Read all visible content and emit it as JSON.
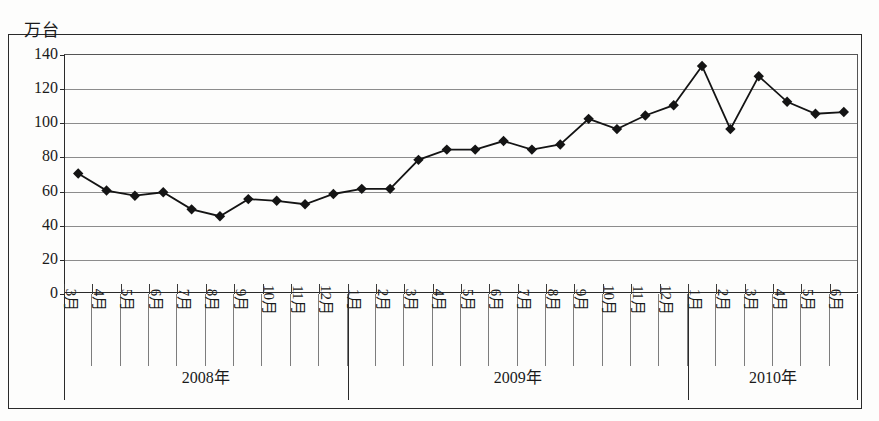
{
  "chart_data": {
    "type": "line",
    "title": "",
    "subtitle": "",
    "xlabel": "",
    "ylabel": "万台",
    "unit_label": "万台",
    "ylim": [
      0,
      140
    ],
    "yticks": [
      0,
      20,
      40,
      60,
      80,
      100,
      120,
      140
    ],
    "ytick_labels": [
      "0",
      "20",
      "40",
      "60",
      "80",
      "100",
      "120",
      "140"
    ],
    "grid": true,
    "legend": "none",
    "marker": "diamond",
    "line_color": "#141414",
    "marker_color": "#141414",
    "grid_color": "#8c8c8c",
    "axis_color": "#2a2a2a",
    "categories": [
      "3月",
      "4月",
      "5月",
      "6月",
      "7月",
      "8月",
      "9月",
      "10月",
      "11月",
      "12月",
      "1月",
      "2月",
      "3月",
      "4月",
      "5月",
      "6月",
      "7月",
      "8月",
      "9月",
      "10月",
      "11月",
      "12月",
      "1月",
      "2月",
      "3月",
      "4月",
      "5月",
      "6月"
    ],
    "values": [
      70,
      60,
      57,
      59,
      49,
      45,
      55,
      54,
      52,
      58,
      61,
      61,
      78,
      84,
      84,
      89,
      84,
      87,
      102,
      96,
      104,
      110,
      133,
      96,
      127,
      112,
      105,
      106
    ],
    "series": [
      {
        "name": "月度销量",
        "values": [
          70,
          60,
          57,
          59,
          49,
          45,
          55,
          54,
          52,
          58,
          61,
          61,
          78,
          84,
          84,
          89,
          84,
          87,
          102,
          96,
          104,
          110,
          133,
          96,
          127,
          112,
          105,
          106
        ]
      }
    ],
    "year_groups": [
      {
        "label": "2008年",
        "start_index": 0,
        "count": 10
      },
      {
        "label": "2009年",
        "start_index": 10,
        "count": 12
      },
      {
        "label": "2010年",
        "start_index": 22,
        "count": 6
      }
    ]
  }
}
